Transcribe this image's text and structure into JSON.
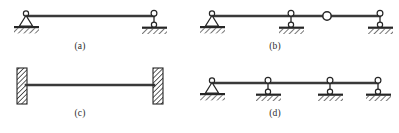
{
  "figure": {
    "kind": "structural-beam-support-diagrams",
    "panel_count": 4,
    "background_color": "#ffffff",
    "ink_color": "#262626",
    "beam_color": "#3a3a3a"
  },
  "captions": {
    "a": "(a)",
    "b": "(b)",
    "c": "(c)",
    "d": "(d)"
  },
  "panels": [
    {
      "id": "a",
      "label": "(a)",
      "description": "Simply supported beam: pin support at left end, roller support at right end",
      "beam": {
        "x1": 26,
        "y1": 16,
        "x2": 154,
        "y2": 16
      },
      "supports": [
        {
          "type": "pin",
          "name": "pin-support",
          "x": 26,
          "y": 16
        },
        {
          "type": "roller",
          "name": "roller-support",
          "x": 154,
          "y": 16
        }
      ],
      "hinges": []
    },
    {
      "id": "b",
      "label": "(b)",
      "description": "Continuous beam with internal hinge: pin support at left, two roller supports, one internal hinge between the second and third supports",
      "beam": {
        "x1": 212,
        "y1": 16,
        "x2": 380,
        "y2": 16
      },
      "supports": [
        {
          "type": "pin",
          "name": "pin-support",
          "x": 212,
          "y": 16
        },
        {
          "type": "roller",
          "name": "roller-support",
          "x": 291,
          "y": 16
        },
        {
          "type": "roller",
          "name": "roller-support",
          "x": 380,
          "y": 16
        }
      ],
      "hinges": [
        {
          "type": "internal-hinge",
          "name": "internal-hinge",
          "x": 327,
          "y": 16
        }
      ]
    },
    {
      "id": "c",
      "label": "(c)",
      "description": "Fixed-fixed beam: built-in (fixed) wall support at both ends",
      "beam": {
        "x1": 28,
        "y1": 85,
        "x2": 152,
        "y2": 85
      },
      "supports": [
        {
          "type": "fixed",
          "name": "fixed-support",
          "x": 22,
          "y": 85,
          "side": "left"
        },
        {
          "type": "fixed",
          "name": "fixed-support",
          "x": 158,
          "y": 85,
          "side": "right"
        }
      ],
      "hinges": []
    },
    {
      "id": "d",
      "label": "(d)",
      "description": "Continuous beam over four supports: pin support at left end and three roller supports",
      "beam": {
        "x1": 212,
        "y1": 83,
        "x2": 378,
        "y2": 83
      },
      "supports": [
        {
          "type": "pin",
          "name": "pin-support",
          "x": 212,
          "y": 83
        },
        {
          "type": "roller",
          "name": "roller-support",
          "x": 268,
          "y": 83
        },
        {
          "type": "roller",
          "name": "roller-support",
          "x": 330,
          "y": 83
        },
        {
          "type": "roller",
          "name": "roller-support",
          "x": 378,
          "y": 83
        }
      ],
      "hinges": []
    }
  ],
  "legend_symbols": {
    "pin": "triangle with hinge circle on hatched ground",
    "roller": "circle on stem over hatched ground",
    "fixed": "vertical hatched wall block",
    "internal_hinge": "small open circle interrupting the beam"
  }
}
